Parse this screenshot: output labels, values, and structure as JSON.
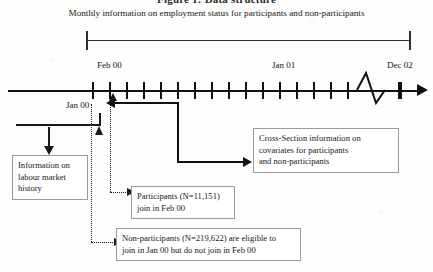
{
  "figure": {
    "clipped_title": "Figure 1: Data structure",
    "caption": "Monthly information on employment status for participants and non-participants"
  },
  "timeline": {
    "labels": {
      "start": "Feb 00",
      "middle": "Jan 01",
      "end": "Dec 02",
      "pre_period": "Jan 00"
    },
    "tick_count": 19,
    "has_axis_break": true,
    "axis_break_symbol": "zigzag"
  },
  "boxes": {
    "history": {
      "lines": [
        "Information on",
        "labour market",
        "history"
      ]
    },
    "cross_section": {
      "lines": [
        "Cross-Section information on",
        "covariates for participants",
        "and non-participants"
      ]
    },
    "participants": {
      "lines": [
        "Participants (N=11,151)",
        "join in Feb 00"
      ],
      "count": "11,151"
    },
    "non_participants": {
      "lines": [
        "Non-participants (N=219,622) are eligible to",
        "join in Jan 00 but do not join in Feb 00"
      ],
      "count": "219,622"
    }
  },
  "colors": {
    "ink": "#111111",
    "box_border": "#9a9a9a",
    "background": "#fdfdfc"
  }
}
